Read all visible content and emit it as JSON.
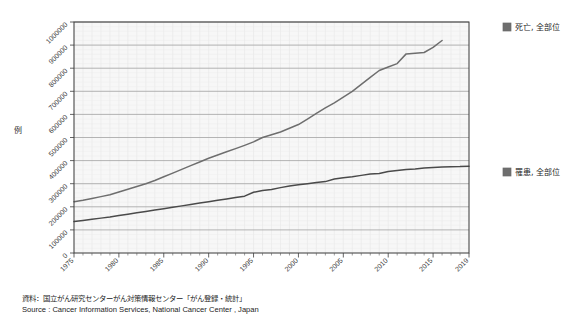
{
  "chart_data": {
    "type": "line",
    "title": "",
    "xlabel": "",
    "ylabel": "例",
    "xlim": [
      1975,
      2019
    ],
    "ylim": [
      0,
      1000000
    ],
    "grid": true,
    "legend_position": "right",
    "x_ticks": [
      "1975",
      "1980",
      "1985",
      "1990",
      "1995",
      "2000",
      "2005",
      "2010",
      "2015",
      "2019"
    ],
    "x_tick_values": [
      1975,
      1980,
      1985,
      1990,
      1995,
      2000,
      2005,
      2010,
      2015,
      2019
    ],
    "y_ticks": [
      "0",
      "100000",
      "200000",
      "300000",
      "400000",
      "500000",
      "600000",
      "700000",
      "800000",
      "900000",
      "1000000"
    ],
    "y_tick_values": [
      0,
      100000,
      200000,
      300000,
      400000,
      500000,
      600000,
      700000,
      800000,
      900000,
      1000000
    ],
    "series": [
      {
        "name": "罹患, 全部位",
        "color": "#6e6e6e",
        "x": [
          1975,
          1976,
          1977,
          1978,
          1979,
          1980,
          1981,
          1982,
          1983,
          1984,
          1985,
          1986,
          1987,
          1988,
          1989,
          1990,
          1991,
          1992,
          1993,
          1994,
          1995,
          1996,
          1997,
          1998,
          1999,
          2000,
          2001,
          2002,
          2003,
          2004,
          2005,
          2006,
          2007,
          2008,
          2009,
          2010,
          2011,
          2012,
          2013,
          2014,
          2015,
          2016
        ],
        "values": [
          222000,
          228000,
          236000,
          244000,
          252000,
          264000,
          276000,
          288000,
          300000,
          314000,
          330000,
          346000,
          362000,
          378000,
          394000,
          410000,
          424000,
          438000,
          452000,
          466000,
          481000,
          500000,
          512000,
          524000,
          540000,
          556000,
          580000,
          604000,
          628000,
          650000,
          675000,
          700000,
          730000,
          760000,
          790000,
          805000,
          820000,
          862000,
          865000,
          868000,
          890000,
          920000
        ]
      },
      {
        "name": "死亡, 全部位",
        "color": "#4a4a4a",
        "x": [
          1975,
          1976,
          1977,
          1978,
          1979,
          1980,
          1981,
          1982,
          1983,
          1984,
          1985,
          1986,
          1987,
          1988,
          1989,
          1990,
          1991,
          1992,
          1993,
          1994,
          1995,
          1996,
          1997,
          1998,
          1999,
          2000,
          2001,
          2002,
          2003,
          2004,
          2005,
          2006,
          2007,
          2008,
          2009,
          2010,
          2011,
          2012,
          2013,
          2014,
          2015,
          2016,
          2017,
          2018,
          2019
        ],
        "values": [
          136000,
          141000,
          146000,
          151000,
          156000,
          162000,
          168000,
          174000,
          180000,
          186000,
          192000,
          198000,
          204000,
          210000,
          216000,
          222000,
          228000,
          234000,
          240000,
          246000,
          263000,
          271000,
          275000,
          283000,
          290000,
          295000,
          300000,
          305000,
          309000,
          320000,
          326000,
          330000,
          336000,
          342000,
          344000,
          353000,
          357000,
          361000,
          364000,
          368000,
          370000,
          372000,
          373000,
          374000,
          376000
        ]
      }
    ]
  },
  "legend": {
    "items": [
      {
        "label": "死亡, 全部位",
        "color": "#6e6e6e"
      },
      {
        "label": "罹患, 全部位",
        "color": "#6e6e6e"
      }
    ]
  },
  "caption": {
    "line1": "資料：国立がん研究センターがん対策情報センター「がん登録・統計」",
    "line2": "Source : Cancer Information Services, National Cancer Center , Japan"
  }
}
